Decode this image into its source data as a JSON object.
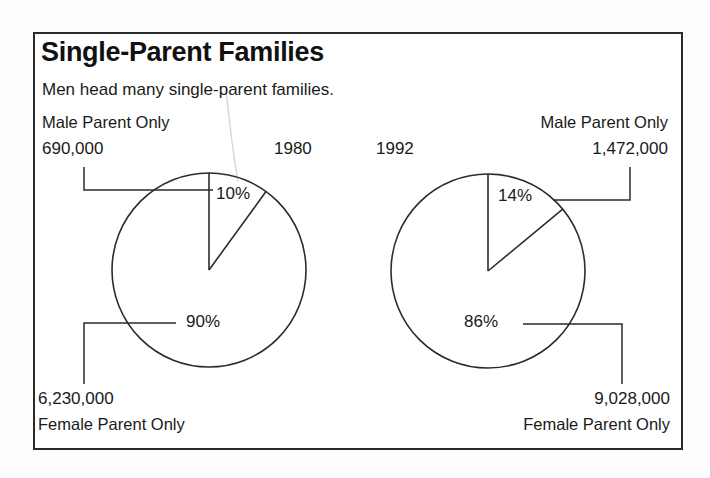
{
  "header": {
    "title": "Single-Parent Families",
    "subtitle": "Men head many single-parent families."
  },
  "panels": {
    "left": {
      "year": "1980",
      "top_label": "Male Parent Only",
      "top_value": "690,000",
      "top_percent": "10%",
      "bottom_percent": "90%",
      "bottom_value": "6,230,000",
      "bottom_label": "Female Parent Only"
    },
    "right": {
      "year": "1992",
      "top_label": "Male Parent Only",
      "top_value": "1,472,000",
      "top_percent": "14%",
      "bottom_percent": "86%",
      "bottom_value": "9,028,000",
      "bottom_label": "Female Parent Only"
    }
  },
  "colors": {
    "ink": "#2b2b2b",
    "frame": "#2a2a2a",
    "paper": "#ffffff",
    "ghost_leader": "#d4d4d4"
  },
  "chart_data": {
    "type": "pie",
    "title": "Single-Parent Families",
    "subtitle": "Men head many single-parent families.",
    "xlabel": "",
    "ylabel": "",
    "legend_position": "none",
    "grid": false,
    "charts": [
      {
        "name": "1980",
        "year": 1980,
        "labels": [
          "Male Parent Only",
          "Female Parent Only"
        ],
        "values": [
          10,
          90
        ],
        "value_labels": [
          "10%",
          "90%"
        ],
        "counts": [
          690000,
          6230000
        ],
        "count_labels": [
          "690,000",
          "6,230,000"
        ],
        "start_angle_deg": 0,
        "direction": "clockwise"
      },
      {
        "name": "1992",
        "year": 1992,
        "labels": [
          "Male Parent Only",
          "Female Parent Only"
        ],
        "values": [
          14,
          86
        ],
        "value_labels": [
          "14%",
          "86%"
        ],
        "counts": [
          1472000,
          9028000
        ],
        "count_labels": [
          "1,472,000",
          "9,028,000"
        ],
        "start_angle_deg": 0,
        "direction": "clockwise"
      }
    ]
  }
}
